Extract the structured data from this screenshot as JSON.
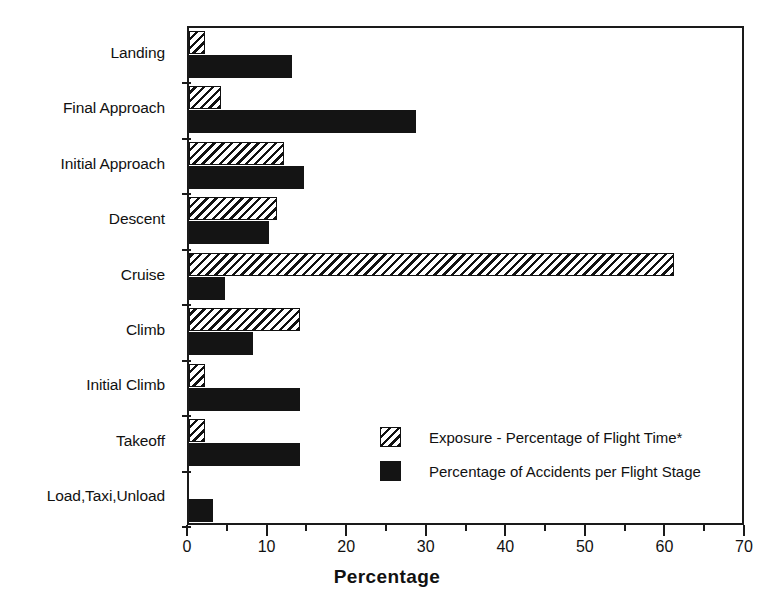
{
  "chart_data": {
    "type": "bar",
    "orientation": "horizontal",
    "title": "",
    "xlabel": "Percentage",
    "ylabel": "",
    "xlim": [
      0,
      70
    ],
    "xticks": [
      0,
      10,
      20,
      30,
      40,
      50,
      60,
      70
    ],
    "xtick_labels": [
      "0",
      "10",
      "20",
      "30",
      "40",
      "50",
      "60",
      "70"
    ],
    "minor_tick_step": 5,
    "grid": false,
    "legend_position": "center-right inside plot",
    "categories": [
      "Landing",
      "Final Approach",
      "Initial Approach",
      "Descent",
      "Cruise",
      "Climb",
      "Initial Climb",
      "Takeoff",
      "Load,Taxi,Unload"
    ],
    "series": [
      {
        "name": "Exposure - Percentage of Flight Time*",
        "fill": "hatched",
        "values": [
          2,
          4,
          12,
          11,
          61,
          14,
          2,
          2,
          0
        ]
      },
      {
        "name": "Percentage of Accidents per Flight Stage",
        "fill": "solid-black",
        "values": [
          13,
          28.5,
          14.5,
          10,
          4.5,
          8,
          14,
          14,
          3
        ]
      }
    ]
  },
  "axis": {
    "x_title": "Percentage"
  },
  "legend": {
    "items": [
      {
        "label": "Exposure - Percentage of Flight Time*",
        "swatch": "hatched-swatch"
      },
      {
        "label": "Percentage of Accidents per Flight Stage",
        "swatch": "black-swatch"
      }
    ]
  },
  "colors": {
    "ink": "#141414",
    "background": "#ffffff",
    "hatch_background": "#e8e8e8"
  }
}
